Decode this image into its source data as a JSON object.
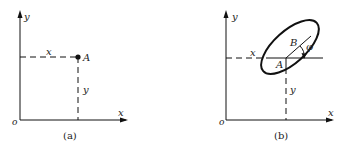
{
  "panels": [
    {
      "id": "a",
      "caption": "(a)",
      "axis_x": "x",
      "axis_y": "y",
      "origin": "o",
      "point": "A",
      "dim_x": "x",
      "dim_y": "y"
    },
    {
      "id": "b",
      "caption": "(b)",
      "axis_x": "x",
      "axis_y": "y",
      "origin": "o",
      "point_a": "A",
      "point_b": "B",
      "angle": "φ",
      "dim_x": "x",
      "dim_y": "y"
    }
  ]
}
